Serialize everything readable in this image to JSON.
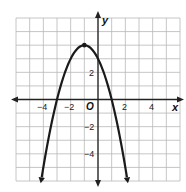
{
  "chart_data": {
    "type": "line",
    "title": "",
    "function": "y = -(x + 1)^2 + 4",
    "xlabel": "x",
    "ylabel": "y",
    "origin_label": "O",
    "xlim": [
      -6,
      6
    ],
    "ylim": [
      -6,
      6
    ],
    "grid": true,
    "grid_step": 1,
    "x_tick_labels": [
      "-4",
      "-2",
      "2",
      "4"
    ],
    "x_tick_values": [
      -4,
      -2,
      2,
      4
    ],
    "y_tick_labels": [
      "2",
      "-2",
      "-4"
    ],
    "y_tick_values": [
      2,
      -2,
      -4
    ],
    "vertex": {
      "x": -1,
      "y": 4
    },
    "y_intercept": 3,
    "roots": [
      -3,
      1
    ],
    "series": [
      {
        "name": "parabola",
        "x": [
          -3.6,
          -3,
          -2,
          -1,
          0,
          1,
          2.1
        ],
        "y": [
          -1.76,
          0,
          3,
          4,
          3,
          0,
          -5.6
        ]
      }
    ],
    "endpoints_arrows": [
      {
        "x": -4.2,
        "y": -6.5
      },
      {
        "x": 2.2,
        "y": -6.5
      }
    ]
  },
  "labels": {
    "x_axis": "x",
    "y_axis": "y",
    "origin": "O",
    "xt_m4": "−4",
    "xt_m2": "−2",
    "xt_2": "2",
    "xt_4": "4",
    "yt_2": "2",
    "yt_m2": "−2",
    "yt_m4": "−4"
  },
  "colors": {
    "grid": "#b8b8b8",
    "axis": "#222222",
    "curve": "#1a1a1a"
  }
}
